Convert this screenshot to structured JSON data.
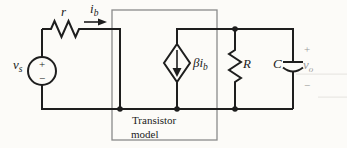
{
  "figure": {
    "type": "circuit-diagram"
  },
  "colors": {
    "bg": "#fcfbf8",
    "wire": "#1e1e1e",
    "box": "#8a8a8a",
    "label": "#1b1b1b",
    "muted": "#9a9a98"
  },
  "labels": {
    "source_voltage": {
      "base": "v",
      "sub": "s"
    },
    "source_plus": "+",
    "source_minus": "−",
    "series_resistor": "r",
    "base_current": {
      "base": "i",
      "sub": "b"
    },
    "dependent_source": {
      "base": "βi",
      "sub": "b"
    },
    "box": {
      "line1": "Transistor",
      "line2": "model"
    },
    "load_resistor": "R",
    "capacitor": "C",
    "output_plus": "+",
    "output_voltage": {
      "base": "v",
      "sub": "o"
    },
    "output_minus": "−"
  }
}
